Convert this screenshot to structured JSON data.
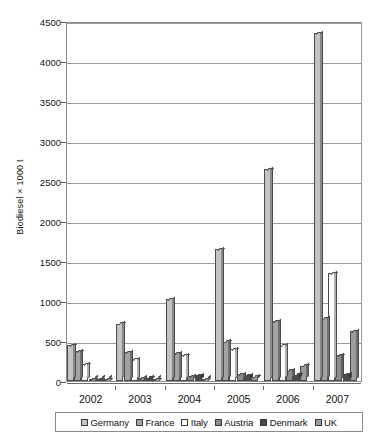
{
  "chart_data": {
    "type": "bar",
    "title": "",
    "xlabel": "",
    "ylabel": "Biodiesel × 1000 t",
    "ylim": [
      0,
      4500
    ],
    "ytick_step": 500,
    "yticks": [
      "0",
      "500",
      "1000",
      "1500",
      "2000",
      "2500",
      "3000",
      "3500",
      "4000",
      "4500"
    ],
    "grid": true,
    "legend_position": "bottom",
    "categories": [
      "2002",
      "2003",
      "2004",
      "2005",
      "2006",
      "2007"
    ],
    "series": [
      {
        "name": "Germany",
        "color": "#c3c3c3",
        "values": [
          450,
          715,
          1020,
          1650,
          2650,
          4350
        ]
      },
      {
        "name": "France",
        "color": "#a3a3a3",
        "values": [
          370,
          360,
          350,
          490,
          745,
          780
        ]
      },
      {
        "name": "Italy",
        "color": "#fdfdfd",
        "values": [
          210,
          270,
          320,
          400,
          440,
          1350
        ]
      },
      {
        "name": "Austria",
        "color": "#8a8a8a",
        "values": [
          25,
          32,
          60,
          85,
          130,
          320
        ]
      },
      {
        "name": "Denmark",
        "color": "#4a4a4a",
        "values": [
          10,
          41,
          70,
          71,
          80,
          85
        ]
      },
      {
        "name": "UK",
        "color": "#9c9c9c",
        "values": [
          3,
          11,
          15,
          51,
          192,
          625
        ]
      }
    ]
  },
  "legend": {
    "items": [
      {
        "label": "Germany"
      },
      {
        "label": "France"
      },
      {
        "label": "Italy"
      },
      {
        "label": "Austria"
      },
      {
        "label": "Denmark"
      },
      {
        "label": "UK"
      }
    ]
  }
}
